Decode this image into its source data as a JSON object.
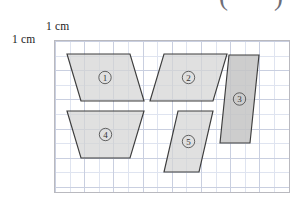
{
  "figure": {
    "annotations": {
      "paren_open": "(",
      "paren_close": ")"
    },
    "scale_label_top": "1 cm",
    "scale_label_left": "1 cm",
    "grid": {
      "cell_cm": 1,
      "cols": 8,
      "rows": 5,
      "minor_divisions": 2,
      "major_line_color": "#c9cfe0",
      "minor_line_color": "#dfe4f0",
      "border_color": "#b9b9bf"
    },
    "shape_style": {
      "fill": "#d4d4d4",
      "stroke": "#3d3d3d"
    },
    "shapes": [
      {
        "id": "shape-1",
        "label": "①",
        "type": "parallelogram",
        "points": "27,61 13,14 76,14 90,61",
        "label_x": 51,
        "label_y": 37.5,
        "dark": false
      },
      {
        "id": "shape-2",
        "label": "②",
        "type": "parallelogram",
        "points": "96,61 110,14 173,14 159,61",
        "label_x": 134.5,
        "label_y": 37.5,
        "dark": false
      },
      {
        "id": "shape-3",
        "label": "③",
        "type": "parallelogram",
        "points": "166,103 175,15 205,15 196,103",
        "label_x": 185.5,
        "label_y": 59,
        "dark": true
      },
      {
        "id": "shape-4",
        "label": "④",
        "type": "parallelogram",
        "points": "13,71 90,71 76,118 27,118",
        "label_x": 51.5,
        "label_y": 94.5,
        "dark": false
      },
      {
        "id": "shape-5",
        "label": "⑤",
        "type": "parallelogram",
        "points": "110,132 124,71 159,71 145,132",
        "label_x": 134.5,
        "label_y": 101.5,
        "dark": false
      }
    ]
  }
}
